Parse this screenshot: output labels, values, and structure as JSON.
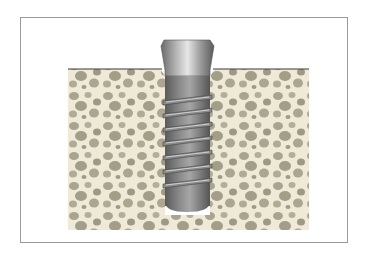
{
  "figure": {
    "colors": {
      "frame_border": "#9a9a9a",
      "background": "#ffffff",
      "bone": "#efe9d8",
      "bone_pores": "#a8a48e",
      "bone_surface_line": "#3a3a3a",
      "implant_light": "#d9d9d9",
      "implant_mid": "#9c9c9c",
      "implant_dark": "#5e5e5e"
    },
    "implant": {
      "thread_count": 7
    }
  }
}
